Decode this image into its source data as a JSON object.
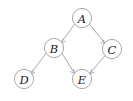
{
  "diagram": {
    "type": "directed-acyclic-graph",
    "title": "",
    "background_color": "#ffffff",
    "node_stroke_color": "#9a9a9a",
    "node_fill_color": "#ffffff",
    "edge_color": "#9a9a9a",
    "label_color": "#1c1c1c",
    "node_radius": 9.6,
    "nodes": [
      {
        "id": "A",
        "label": "A",
        "cx": 82,
        "cy": 18
      },
      {
        "id": "B",
        "label": "B",
        "cx": 54,
        "cy": 48
      },
      {
        "id": "C",
        "label": "C",
        "cx": 112,
        "cy": 49
      },
      {
        "id": "D",
        "label": "D",
        "cx": 24,
        "cy": 79
      },
      {
        "id": "E",
        "label": "E",
        "cx": 82,
        "cy": 79
      }
    ],
    "edges": [
      {
        "from": "A",
        "to": "B",
        "directed": true
      },
      {
        "from": "A",
        "to": "C",
        "directed": true
      },
      {
        "from": "B",
        "to": "D",
        "directed": true
      },
      {
        "from": "B",
        "to": "E",
        "directed": true
      },
      {
        "from": "C",
        "to": "E",
        "directed": true
      }
    ]
  }
}
